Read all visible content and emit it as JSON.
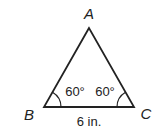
{
  "diagram": {
    "type": "triangle",
    "vertices": [
      {
        "label": "A",
        "x": 89,
        "y": 28
      },
      {
        "label": "B",
        "x": 44,
        "y": 107
      },
      {
        "label": "C",
        "x": 134,
        "y": 107
      }
    ],
    "angles": {
      "B": "60°",
      "C": "60°"
    },
    "sides": {
      "BC": "6 in."
    },
    "stroke_color": "#222222"
  }
}
